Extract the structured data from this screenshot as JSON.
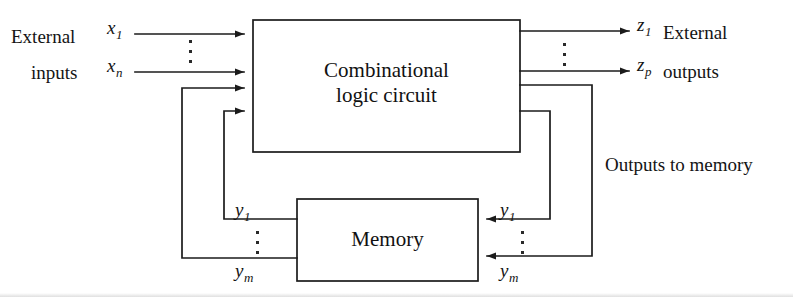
{
  "figure": {
    "type": "block-diagram",
    "blocks": [
      {
        "id": "combinational",
        "label": "Combinational\nlogic circuit"
      },
      {
        "id": "memory",
        "label": "Memory"
      }
    ],
    "labels": {
      "external_inputs_line1": "External",
      "external_inputs_line2": "inputs",
      "external_outputs_line1": "External",
      "external_outputs_line2": "outputs",
      "outputs_to_memory": "Outputs to memory"
    },
    "signals": {
      "input_first": {
        "name": "x",
        "sub": "1"
      },
      "input_last": {
        "name": "x",
        "sub": "n"
      },
      "output_first": {
        "name": "z",
        "sub": "1"
      },
      "output_last": {
        "name": "z",
        "sub": "p"
      },
      "state_first_left": {
        "name": "y",
        "sub": "1"
      },
      "state_last_left": {
        "name": "y",
        "sub": "m"
      },
      "state_first_right": {
        "name": "y",
        "sub": "1"
      },
      "state_last_right": {
        "name": "y",
        "sub": "m"
      }
    },
    "colors": {
      "stroke": "#1b1b1b",
      "background": "#ffffff",
      "text": "#141414"
    }
  }
}
